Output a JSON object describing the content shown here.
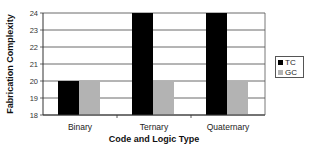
{
  "chart_data": {
    "type": "bar",
    "title": "",
    "xlabel": "Code and Logic Type",
    "ylabel": "Fabrication Complexity",
    "categories": [
      "Binary",
      "Ternary",
      "Quaternary"
    ],
    "series": [
      {
        "name": "TC",
        "color": "#000000",
        "values": [
          20,
          24,
          24
        ]
      },
      {
        "name": "GC",
        "color": "#b3b3b3",
        "values": [
          20,
          20,
          20
        ]
      }
    ],
    "ylim": [
      18,
      24
    ],
    "yticks": [
      18,
      19,
      20,
      21,
      22,
      23,
      24
    ],
    "grid": true,
    "legend_position": "right"
  },
  "legend": {
    "items": [
      {
        "label": "TC",
        "color": "#000000"
      },
      {
        "label": "GC",
        "color": "#b3b3b3"
      }
    ]
  }
}
